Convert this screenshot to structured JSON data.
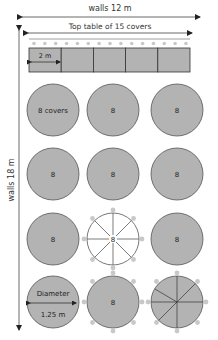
{
  "diagram": {
    "walls_horizontal_label": "walls 12 m",
    "walls_vertical_label": "walls 18 m",
    "top_table": {
      "label": "Top table of 15 covers",
      "cover_count": 15,
      "segments": 5,
      "segment_label": "2 m"
    },
    "round_tables": {
      "first_label": "8 covers",
      "default_label": "8",
      "diameter_label": "Diameter",
      "diameter_value": "1.25 m",
      "rows": [
        [
          {
            "label": "8 covers",
            "style": "solid"
          },
          {
            "label": "8",
            "style": "solid"
          },
          {
            "label": "8",
            "style": "solid"
          }
        ],
        [
          {
            "label": "8",
            "style": "solid"
          },
          {
            "label": "8",
            "style": "solid"
          },
          {
            "label": "8",
            "style": "solid"
          }
        ],
        [
          {
            "label": "8",
            "style": "solid"
          },
          {
            "label": "8",
            "style": "spokes-open"
          },
          {
            "label": "8",
            "style": "solid"
          }
        ],
        [
          {
            "label": "Diameter",
            "sublabel": "1.25 m",
            "style": "diameter"
          },
          {
            "label": "8",
            "style": "solid-seated"
          },
          {
            "label": "",
            "style": "segmented-seated"
          }
        ]
      ]
    },
    "colors": {
      "table_fill": "#b3b3b3",
      "table_stroke": "#555555",
      "seat_fill": "#c8c8c8",
      "line": "#333333"
    }
  }
}
